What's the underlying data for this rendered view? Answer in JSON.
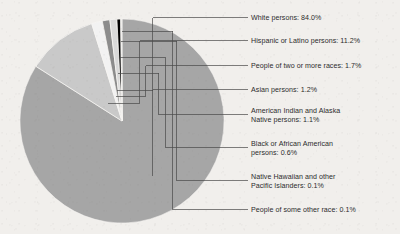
{
  "figure": {
    "title": "",
    "background_color": "#f1efec",
    "text_color": "#2c2c2c",
    "leader_line_color": "#4a4a4a"
  },
  "chart_data": {
    "type": "pie",
    "title": "",
    "xlabel": "",
    "ylabel": "",
    "legend_position": "right-callouts",
    "grid": false,
    "units": "percent",
    "start_angle_deg": -90,
    "direction": "clockwise",
    "center": {
      "x": 122,
      "y": 121,
      "radius": 102
    },
    "categories": [
      "White persons",
      "Hispanic or Latino persons",
      "People of two or more races",
      "Asian persons",
      "American Indian and Alaska Native persons",
      "Black or African American persons",
      "Native Hawaiian and other Pacific Islanders",
      "People of some other race"
    ],
    "values": [
      84.0,
      11.2,
      1.7,
      1.2,
      1.1,
      0.6,
      0.1,
      0.1
    ],
    "colors": [
      "#a6a6a6",
      "#c9c9c9",
      "#f2f2f2",
      "#8c8c8c",
      "#d9d9d9",
      "#000000",
      "#595959",
      "#bfbfbf"
    ],
    "slices": [
      {
        "label": "White persons",
        "value": 84.0,
        "value_text": "84.0%",
        "color": "#a6a6a6"
      },
      {
        "label": "Hispanic or Latino persons",
        "value": 11.2,
        "value_text": "11.2%",
        "color": "#c9c9c9"
      },
      {
        "label": "People of two or more races",
        "value": 1.7,
        "value_text": "1.7%",
        "color": "#f2f2f2"
      },
      {
        "label": "Asian persons",
        "value": 1.2,
        "value_text": "1.2%",
        "color": "#8c8c8c"
      },
      {
        "label": "American Indian and Alaska Native persons",
        "value": 1.1,
        "value_text": "1.1%",
        "color": "#d9d9d9"
      },
      {
        "label": "Black or African American persons",
        "value": 0.6,
        "value_text": "0.6%",
        "color": "#000000"
      },
      {
        "label": "Native Hawaiian and other Pacific Islanders",
        "value": 0.1,
        "value_text": "0.1%",
        "color": "#595959"
      },
      {
        "label": "People of some other race",
        "value": 0.1,
        "value_text": "0.1%",
        "color": "#bfbfbf"
      }
    ]
  },
  "callouts": [
    {
      "text": "White persons: 84.0%"
    },
    {
      "text": "Hispanic or Latino persons: 11.2%"
    },
    {
      "text": "People of two or more races: 1.7%"
    },
    {
      "text": "Asian persons: 1.2%"
    },
    {
      "text": "American Indian and Alaska\nNative persons: 1.1%"
    },
    {
      "text": "Black or African American\npersons: 0.6%"
    },
    {
      "text": "Native Hawaiian and other\nPacific Islanders: 0.1%"
    },
    {
      "text": "People of some other race: 0.1%"
    }
  ]
}
